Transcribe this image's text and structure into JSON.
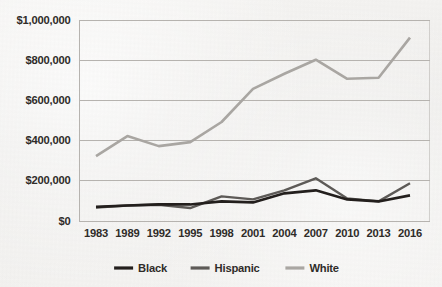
{
  "chart_data": {
    "type": "line",
    "title": "",
    "subtitle": "",
    "xlabel": "",
    "ylabel": "",
    "categories": [
      "1983",
      "1989",
      "1992",
      "1995",
      "1998",
      "2001",
      "2004",
      "2007",
      "2010",
      "2013",
      "2016"
    ],
    "x": [
      1983,
      1989,
      1992,
      1995,
      1998,
      2001,
      2004,
      2007,
      2010,
      2013,
      2016
    ],
    "series": [
      {
        "name": "Black",
        "color": "#231f1d",
        "values": [
          68000,
          75000,
          80000,
          80000,
          95000,
          90000,
          135000,
          150000,
          105000,
          95000,
          125000
        ]
      },
      {
        "name": "Hispanic",
        "color": "#5d5a57",
        "values": [
          65000,
          75000,
          78000,
          62000,
          120000,
          105000,
          150000,
          210000,
          110000,
          95000,
          185000
        ]
      },
      {
        "name": "White",
        "color": "#a9a6a2",
        "values": [
          320000,
          420000,
          370000,
          390000,
          490000,
          655000,
          730000,
          800000,
          705000,
          710000,
          910000
        ]
      }
    ],
    "ylim": [
      0,
      1000000
    ],
    "ytick_values": [
      0,
      200000,
      400000,
      600000,
      800000,
      1000000
    ],
    "ytick_labels": [
      "$0",
      "$200,000",
      "$400,000",
      "$600,000",
      "$800,000",
      "$1,000,000"
    ],
    "grid": true,
    "grid_axis": "y",
    "legend_position": "bottom",
    "legend": [
      "Black",
      "Hispanic",
      "White"
    ],
    "annotations": []
  },
  "axis": {
    "y_labels": [
      "$1,000,000",
      "$800,000",
      "$600,000",
      "$400,000",
      "$200,000",
      "$0"
    ],
    "x_labels": [
      "1983",
      "1989",
      "1992",
      "1995",
      "1998",
      "2001",
      "2004",
      "2007",
      "2010",
      "2013",
      "2016"
    ]
  },
  "legend": {
    "items": [
      {
        "label": "Black",
        "color": "#231f1d"
      },
      {
        "label": "Hispanic",
        "color": "#5d5a57"
      },
      {
        "label": "White",
        "color": "#a9a6a2"
      }
    ]
  },
  "style": {
    "background": "#f2f1ef",
    "gridline_color": "#b6b3af",
    "axis_color": "#b6b3af",
    "text_color": "#2f2c29"
  }
}
